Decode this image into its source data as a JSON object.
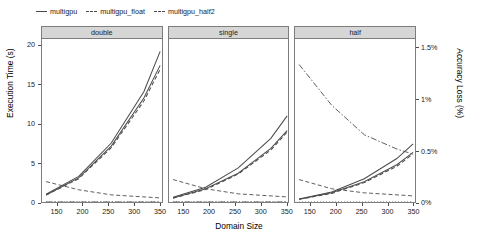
{
  "chart_data": {
    "type": "line",
    "title": "",
    "xlabel": "Domain Size",
    "ylabel": "Execution Time (s)",
    "y2label": "Accuracy Loss (%)",
    "xlim": [
      120,
      355
    ],
    "ylim": [
      0,
      21
    ],
    "y2lim": [
      0,
      1.6
    ],
    "grid": false,
    "legend_position": "top-left",
    "facet_labels": [
      "double",
      "single",
      "half"
    ],
    "xticks": [
      150,
      200,
      250,
      300,
      350
    ],
    "xticklabels": [
      "150",
      "200",
      "250",
      "300",
      "350"
    ],
    "yticks": [
      0,
      5,
      10,
      15,
      20
    ],
    "yticklabels": [
      "0",
      "5",
      "10",
      "15",
      "20"
    ],
    "y2ticks": [
      0,
      0.5,
      1,
      1.5
    ],
    "y2ticklabels": [
      "0%",
      "0.5%",
      "1%",
      "1.5%"
    ],
    "legend": [
      {
        "label": "multigpu",
        "dash": "solid"
      },
      {
        "label": "multigpu_float",
        "dash": "solid"
      },
      {
        "label": "multigpu_half2",
        "dash": "solid"
      }
    ],
    "x": [
      128,
      192,
      256,
      320,
      352
    ],
    "facets": [
      {
        "name": "double",
        "time_series": [
          {
            "name": "multigpu",
            "values": [
              1.0,
              3.3,
              7.6,
              14.2,
              19.4
            ]
          },
          {
            "name": "multigpu_float",
            "values": [
              0.9,
              3.0,
              7.0,
              13.0,
              17.1
            ]
          },
          {
            "name": "multigpu_half2",
            "values": [
              0.9,
              3.1,
              7.2,
              13.4,
              17.6
            ]
          }
        ],
        "accuracy_series": [
          {
            "name": "multigpu",
            "values": [
              0.0,
              0.0,
              0.0,
              0.0,
              0.0
            ]
          },
          {
            "name": "multigpu_float",
            "values": [
              0.2,
              0.12,
              0.07,
              0.05,
              0.04
            ]
          },
          {
            "name": "multigpu_half2",
            "values": [
              0.0,
              0.0,
              0.0,
              0.0,
              0.0
            ]
          }
        ]
      },
      {
        "name": "single",
        "time_series": [
          {
            "name": "multigpu",
            "values": [
              0.6,
              1.9,
              4.4,
              8.2,
              11.1
            ]
          },
          {
            "name": "multigpu_float",
            "values": [
              0.5,
              1.6,
              3.6,
              6.7,
              9.0
            ]
          },
          {
            "name": "multigpu_half2",
            "values": [
              0.5,
              1.7,
              3.7,
              6.9,
              9.2
            ]
          }
        ],
        "accuracy_series": [
          {
            "name": "multigpu",
            "values": [
              0.0,
              0.0,
              0.0,
              0.0,
              0.0
            ]
          },
          {
            "name": "multigpu_float",
            "values": [
              0.22,
              0.13,
              0.08,
              0.06,
              0.05
            ]
          },
          {
            "name": "multigpu_half2",
            "values": [
              0.0,
              0.0,
              0.0,
              0.0,
              0.0
            ]
          }
        ]
      },
      {
        "name": "half",
        "time_series": [
          {
            "name": "multigpu",
            "values": [
              0.4,
              1.3,
              3.0,
              5.6,
              7.5
            ]
          },
          {
            "name": "multigpu_float",
            "values": [
              0.35,
              1.1,
              2.5,
              4.6,
              6.2
            ]
          },
          {
            "name": "multigpu_half2",
            "values": [
              0.35,
              1.2,
              2.6,
              4.8,
              6.4
            ]
          }
        ],
        "accuracy_series": [
          {
            "name": "multigpu",
            "values": [
              0.0,
              0.0,
              0.0,
              0.0,
              0.0
            ]
          },
          {
            "name": "multigpu_float",
            "values": [
              0.22,
              0.13,
              0.09,
              0.07,
              0.06
            ]
          },
          {
            "name": "multigpu_half2",
            "values": [
              1.35,
              0.95,
              0.66,
              0.52,
              0.47
            ]
          }
        ]
      }
    ],
    "colors": {
      "series_line": "#4d4d4d",
      "strip_background": "#d6d6d6",
      "panel_border": "#7d7d7d",
      "background": "#ffffff"
    }
  }
}
